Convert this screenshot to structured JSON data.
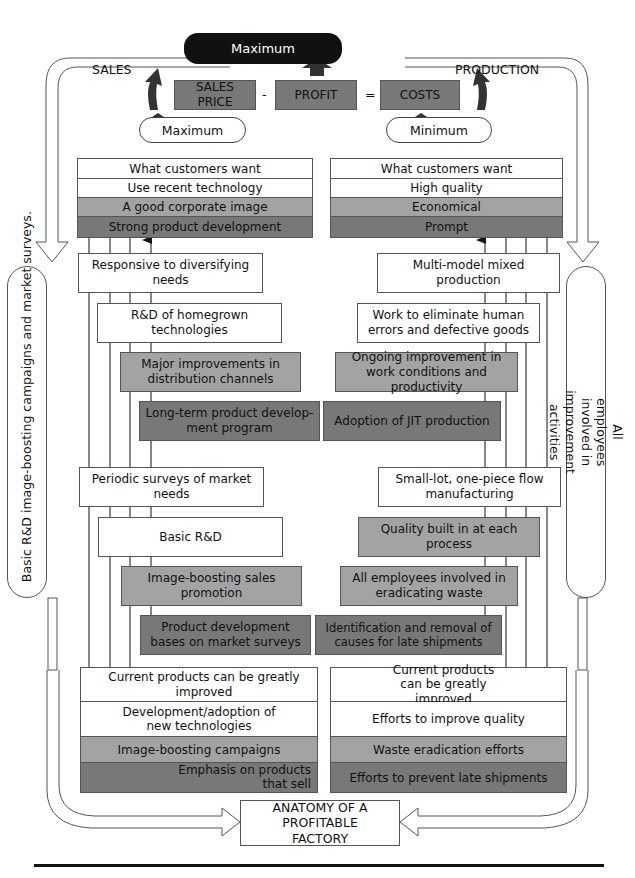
{
  "top": {
    "maximum": "Maximum",
    "sales_label": "SALES",
    "production_label": "PRODUCTION",
    "equation": {
      "sales_price": "SALES PRICE",
      "minus": "-",
      "profit": "PROFIT",
      "equals": "=",
      "costs": "COSTS"
    },
    "left_pill": "Maximum",
    "right_pill": "Minimum"
  },
  "sales": {
    "goals": [
      "What customers want",
      "Use recent technology",
      "A good corporate image",
      "Strong product development"
    ],
    "steps": [
      "Responsive to diversifying needs",
      "R&D of homegrown technologies",
      "Major improvements in distribution channels",
      "Long-term product develop-ment program",
      "Periodic surveys of market needs",
      "Basic R&D",
      "Image-boosting sales promotion",
      "Product development bases on market surveys"
    ],
    "base": [
      "Current products can be greatly improved",
      "Development/adoption of new technologies",
      "Image-boosting campaigns",
      "Emphasis on products that sell"
    ]
  },
  "production": {
    "goals": [
      "What customers want",
      "High quality",
      "Economical",
      "Prompt"
    ],
    "steps": [
      "Multi-model mixed production",
      "Work to eliminate human errors and defective goods",
      "Ongoing improvement in work conditions and productivity",
      "Adoption of JIT production",
      "Small-lot, one-piece flow manufacturing",
      "Quality built in at each process",
      "All employees involved in eradicating waste",
      "Identification and removal of causes for late shipments"
    ],
    "base": [
      "Current products can be greatly improved",
      "Efforts to improve quality",
      "Waste eradication efforts",
      "Efforts to prevent late shipments"
    ]
  },
  "side": {
    "left": "Basic R&D image-boosting campaigns and market surveys.",
    "right": "All employees involved in improvement activities"
  },
  "footer": {
    "title": "ANATOMY OF A PROFITABLE FACTORY"
  },
  "colors": {
    "white": "#ffffff",
    "light_gray": "#a3a3a3",
    "dark_gray": "#787878",
    "black": "#111111"
  }
}
